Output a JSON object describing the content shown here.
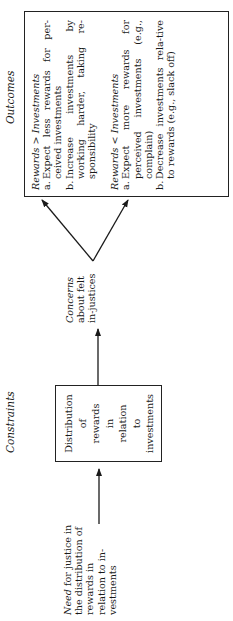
{
  "headings": {
    "constraints": "Constraints",
    "outcomes": "Outcomes"
  },
  "input": {
    "need_prefix": "Need",
    "need_rest": " for justice in the distribution of rewards in relation to in-vestments"
  },
  "constraint_box": {
    "lines": [
      "Distribution",
      "of",
      "rewards",
      "in",
      "relation",
      "to",
      "investments"
    ]
  },
  "concerns": {
    "prefix": "Concerns",
    "rest": "about felt in-justices"
  },
  "outcomes": {
    "group1": {
      "title_left": "Rewards",
      "operator": ">",
      "title_right": "Investments",
      "items": [
        {
          "label": "a.",
          "text": "Expect less rewards for per-ceived investments"
        },
        {
          "label": "b.",
          "text": "Increase investments by working harder, taking re-sponsibility"
        }
      ]
    },
    "group2": {
      "title_left": "Rewards",
      "operator": "<",
      "title_right": "Investments",
      "items": [
        {
          "label": "a.",
          "text": "Expect more rewards for perceived investments (e.g., complain)"
        },
        {
          "label": "b.",
          "text": "Decrease investments rela-tive to rewards (e.g., slack off)"
        }
      ]
    }
  },
  "colors": {
    "ink": "#1a1a1a",
    "background": "#ffffff"
  }
}
